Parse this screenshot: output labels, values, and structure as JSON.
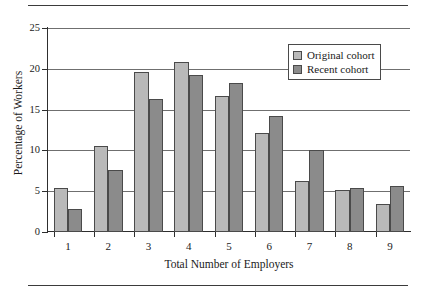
{
  "chart_data": {
    "type": "bar",
    "title": "",
    "xlabel": "Total Number of Employers",
    "ylabel": "Percentage of Workers",
    "categories": [
      "1",
      "2",
      "3",
      "4",
      "5",
      "6",
      "7",
      "8",
      "9"
    ],
    "series": [
      {
        "name": "Original cohort",
        "color": "#b9b9b9",
        "values": [
          5.4,
          10.5,
          19.6,
          20.8,
          16.7,
          12.1,
          6.2,
          5.1,
          3.4
        ]
      },
      {
        "name": "Recent cohort",
        "color": "#8b8b8b",
        "values": [
          2.8,
          7.6,
          16.3,
          19.3,
          18.3,
          14.2,
          10.1,
          5.4,
          5.6
        ]
      }
    ],
    "ylim": [
      0,
      25
    ],
    "yticks": [
      0,
      5,
      10,
      15,
      20,
      25
    ],
    "ytick_labels": [
      "0",
      "5",
      "10",
      "15",
      "20",
      "25"
    ],
    "grid": "horizontal",
    "legend_position": "top-right",
    "bar_edge_color": "#4a4a4a",
    "axis_color": "#2e2e2e",
    "gridline_color": "#6f6f6f",
    "background": "#ffffff"
  }
}
